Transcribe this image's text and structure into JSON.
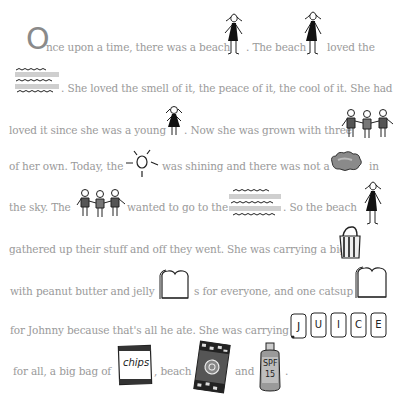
{
  "story": {
    "dropcap": "O",
    "lines": [
      {
        "segments": [
          "nce upon a time, there was a beach",
          ". The beach",
          "loved the"
        ]
      },
      {
        "segments": [
          ". She loved the smell of it, the peace of it, the cool of it. She had"
        ]
      },
      {
        "segments": [
          "loved it since she was a young",
          ". Now she was grown with three"
        ]
      },
      {
        "segments": [
          "of her own. Today, the",
          "was shining and there was not a",
          "in"
        ]
      },
      {
        "segments": [
          "the sky.  The",
          "wanted to go to  the",
          ". So the beach"
        ]
      },
      {
        "segments": [
          "gathered up their stuff and off they went. She was carrying a big"
        ]
      },
      {
        "segments": [
          "with peanut butter and jelly",
          "s for everyone, and one catsup"
        ]
      },
      {
        "segments": [
          "for Johnny because that's all he ate. She was carrying"
        ]
      },
      {
        "segments": [
          "for all, a big bag of",
          ", beach",
          "and",
          "."
        ]
      }
    ]
  },
  "icons": {
    "woman_1": "woman-icon",
    "woman_2": "woman-icon",
    "ocean_1": "ocean-waves-icon",
    "girl": "girl-icon",
    "children_1": "three-children-icon",
    "sun": "sun-icon",
    "cloud": "cloud-icon",
    "children_2": "three-children-icon",
    "ocean_2": "ocean-waves-icon",
    "woman_3": "woman-icon",
    "bag": "tote-bag-icon",
    "bread_1": "bread-slice-icon",
    "bread_2": "bread-slice-icon",
    "juice_letters": [
      "J",
      "U",
      "I",
      "C",
      "E"
    ],
    "chips_label": "chips",
    "towel": "beach-towel-icon",
    "sunscreen_label_top": "SPF",
    "sunscreen_label_bottom": "15"
  },
  "colors": {
    "text": "#9a9a9a",
    "ink": "#1a1a1a",
    "background": "#ffffff"
  }
}
